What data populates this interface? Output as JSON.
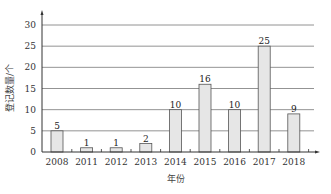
{
  "chart_data": {
    "type": "bar",
    "title": "",
    "xlabel": "年份",
    "ylabel": "登记数量/个",
    "categories": [
      "2008",
      "2011",
      "2012",
      "2013",
      "2014",
      "2015",
      "2016",
      "2017",
      "2018"
    ],
    "values": [
      5,
      1,
      1,
      2,
      10,
      16,
      10,
      25,
      9
    ],
    "ylim": [
      0,
      30
    ],
    "yticks": [
      0,
      5,
      10,
      15,
      20,
      25,
      30
    ],
    "grid": true,
    "legend": null,
    "bar_color": "#e6e6e6",
    "bar_edge_color": "#555555",
    "grid_color": "#777777"
  }
}
